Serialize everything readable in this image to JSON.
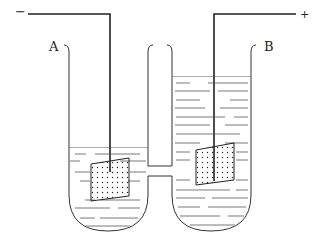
{
  "diagram": {
    "type": "electrolysis U-tube cell",
    "terminals": {
      "negative": "−",
      "positive": "+"
    },
    "labels": {
      "left_tube": "A",
      "right_tube": "B"
    },
    "colors": {
      "line": "#222222",
      "liquid_lines": "#555555",
      "background": "#ffffff"
    }
  }
}
